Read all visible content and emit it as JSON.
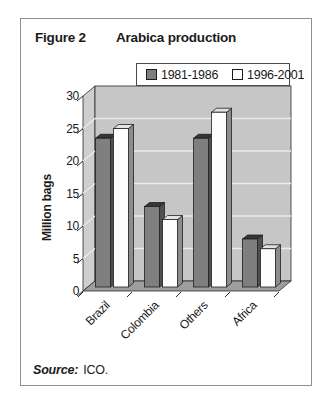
{
  "figure_label": "Figure 2",
  "title": "Arabica production",
  "legend": {
    "items": [
      {
        "label": "1981-1986",
        "fill": "#7f7f7f"
      },
      {
        "label": "1996-2001",
        "fill": "#ffffff"
      }
    ]
  },
  "source": {
    "label": "Source:",
    "value": "ICO."
  },
  "chart_data": {
    "type": "bar",
    "style": "3d-clustered-column",
    "title": "Arabica production",
    "categories": [
      "Brazil",
      "Colombia",
      "Others",
      "Africa"
    ],
    "series": [
      {
        "name": "1981-1986",
        "values": [
          23.5,
          13,
          23.5,
          8
        ]
      },
      {
        "name": "1996-2001",
        "values": [
          25,
          11,
          27.5,
          6.5
        ]
      }
    ],
    "xlabel": "",
    "ylabel": "Million bags",
    "ylim": [
      0,
      30
    ],
    "ytick_step": 5,
    "grid": true,
    "legend_position": "top-right"
  },
  "colors": {
    "frame_border": "#8f8f8f",
    "back_wall": "#c6c6c6",
    "side_wall": "#cecece",
    "floor": "#9e9e9e",
    "gridline": "#ebebeb",
    "axis_line": "#2a2a2a",
    "bar_outline": "#1f1f1f",
    "series1_front": "#7f7f7f",
    "series1_top": "#353535",
    "series1_side": "#4f4f4f",
    "series2_front": "#fdfdfd",
    "series2_top": "#e2e2e2",
    "series2_side": "#8c8c8c",
    "text": "#1a1a1a"
  }
}
